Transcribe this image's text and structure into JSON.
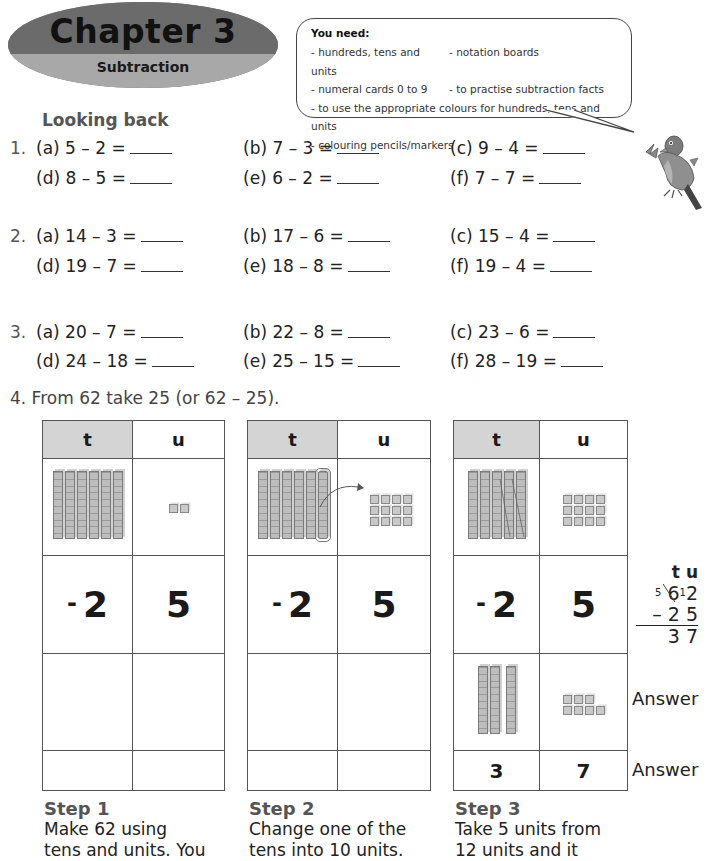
{
  "banner": {
    "chapter": "Chapter 3",
    "subtitle": "Subtraction"
  },
  "you_need": {
    "title": "You need:",
    "rows": [
      [
        "- hundreds, tens and units",
        "- notation boards"
      ],
      [
        "- numeral cards 0 to 9",
        "- to practise subtraction facts"
      ]
    ],
    "full_rows": [
      "- to use the appropriate colours for hundreds, tens and units",
      "- colouring pencils/markers"
    ]
  },
  "section_heading": "Looking back",
  "questions": [
    {
      "number": "1.",
      "items": [
        [
          "(a) 5 – 2 =",
          "(b) 7 – 3 =",
          "(c) 9 – 4 ="
        ],
        [
          "(d) 8 – 5 =",
          "(e) 6 – 2 =",
          "(f) 7 – 7  ="
        ]
      ]
    },
    {
      "number": "2.",
      "items": [
        [
          "(a) 14 – 3  =",
          "(b) 17 – 6 =",
          "(c) 15 – 4 ="
        ],
        [
          "(d) 19 – 7  =",
          "(e) 18 – 8 =",
          "(f) 19 – 4 ="
        ]
      ]
    },
    {
      "number": "3.",
      "items": [
        [
          "(a) 20 – 7   =",
          "(b) 22 – 8  =",
          "(c) 23 – 6  ="
        ],
        [
          "(d) 24 – 18 =",
          "(e) 25 – 15 =",
          "(f) 28 – 19 ="
        ]
      ]
    }
  ],
  "question4": {
    "text": "4.  From 62 take 25 (or 62 – 25).",
    "col_headers": [
      "t",
      "u"
    ],
    "subtrahend": {
      "minus": "-",
      "tens": "2",
      "units": "5"
    },
    "steps": [
      {
        "label": "Step 1",
        "text": [
          "Make 62 using",
          "tens and units. You"
        ],
        "tens_rods": 6,
        "unit_cubes": 2
      },
      {
        "label": "Step 2",
        "text": [
          "Change one of the",
          "tens into 10 units."
        ],
        "tens_rods": 6,
        "unit_cubes": 12
      },
      {
        "label": "Step 3",
        "text": [
          "Take 5 units from",
          "12 units and it"
        ],
        "tens_rods": 5,
        "unit_cubes": 12,
        "result_rods": 3,
        "result_cubes": 7,
        "answer_tens": "3",
        "answer_units": "7"
      }
    ],
    "vertical_sum": {
      "header": "t u",
      "crossed_tens": "6",
      "new_tens": "5",
      "carry": "1",
      "units": "2",
      "subtract_line": "– 2 5",
      "result": "3 7"
    },
    "answer_label": "Answer"
  }
}
